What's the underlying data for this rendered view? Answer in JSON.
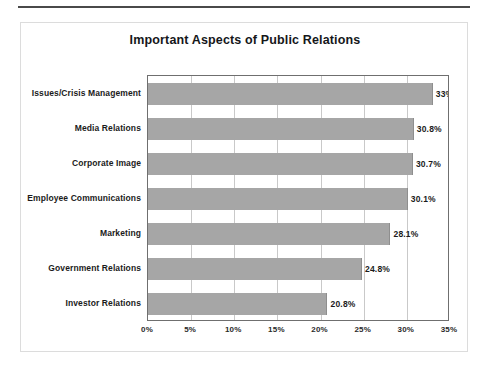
{
  "document": {
    "rule_label": "horizontal-rule"
  },
  "chart_data": {
    "type": "bar",
    "orientation": "horizontal",
    "title": "Important Aspects of Public Relations",
    "xlabel": "",
    "ylabel": "",
    "categories": [
      "Issues/Crisis Management",
      "Media Relations",
      "Corporate Image",
      "Employee Communications",
      "Marketing",
      "Government Relations",
      "Investor Relations"
    ],
    "values": [
      33.0,
      30.8,
      30.7,
      30.1,
      28.1,
      24.8,
      20.8
    ],
    "value_labels": [
      "33%",
      "30.8%",
      "30.7%",
      "30.1%",
      "28.1%",
      "24.8%",
      "20.8%"
    ],
    "xlim": [
      0,
      35
    ],
    "xticks": [
      0,
      5,
      10,
      15,
      20,
      25,
      30,
      35
    ],
    "xticklabels": [
      "0%",
      "5%",
      "10%",
      "15%",
      "20%",
      "25%",
      "30%",
      "35%"
    ],
    "grid": "vertical",
    "legend": null,
    "bar_color": "#a6a6a6",
    "plot_border_color": "#6f6f6f",
    "gridline_color": "#c9c9c9",
    "text_color": "#1b1b1b"
  }
}
